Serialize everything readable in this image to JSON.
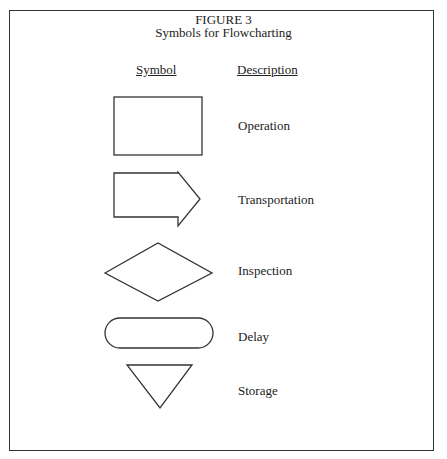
{
  "figure": {
    "number": "FIGURE 3",
    "title": "Symbols for Flowcharting"
  },
  "headers": {
    "symbol": "Symbol",
    "description": "Description"
  },
  "symbols": [
    {
      "shape": "rectangle",
      "description": "Operation"
    },
    {
      "shape": "arrow",
      "description": "Transportation"
    },
    {
      "shape": "diamond",
      "description": "Inspection"
    },
    {
      "shape": "rounded-rectangle",
      "description": "Delay"
    },
    {
      "shape": "inverted-triangle",
      "description": "Storage"
    }
  ]
}
